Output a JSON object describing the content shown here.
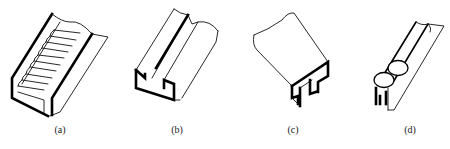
{
  "figure": {
    "panels": [
      {
        "id": "a",
        "label": "(a)",
        "depicts": "ribbed trough / serrated channel guide"
      },
      {
        "id": "b",
        "label": "(b)",
        "depicts": "open rectangular slot channel"
      },
      {
        "id": "c",
        "label": "(c)",
        "depicts": "inverted T-slot / hat profile block"
      },
      {
        "id": "d",
        "label": "(d)",
        "depicts": "double ball (rolling element) rail"
      }
    ],
    "colors": {
      "line": "#000000",
      "background": "#ffffff"
    }
  }
}
